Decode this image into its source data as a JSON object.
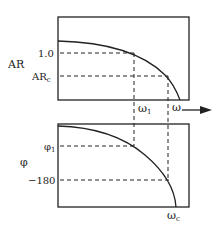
{
  "top_plot": {
    "ylabel": "AR",
    "ticks": {
      "one": "1.0",
      "arc": "AR",
      "arc_sub": "c"
    },
    "xmarks": {
      "w1": "ω",
      "w1_sub": "1",
      "w": "ω"
    }
  },
  "bottom_plot": {
    "ylabel": "φ",
    "ticks": {
      "phi1": "φ",
      "phi1_sub": "1",
      "m180": "−180"
    },
    "xmarks": {
      "wc": "ω",
      "wc_sub": "c"
    }
  },
  "colors": {
    "line": "#222222"
  }
}
